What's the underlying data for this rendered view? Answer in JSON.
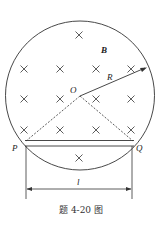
{
  "figure": {
    "caption": "题 4-20 图",
    "labels": {
      "field": "B",
      "radius": "R",
      "center": "O",
      "left_point": "P",
      "right_point": "Q",
      "length": "l"
    },
    "field_symbol": "×",
    "stroke_color": "#333333"
  }
}
